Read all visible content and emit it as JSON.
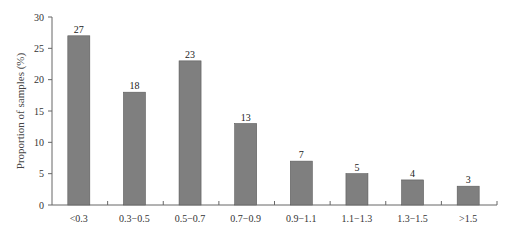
{
  "chart_data": {
    "type": "bar",
    "title": "",
    "xlabel": "",
    "ylabel": "Proportion of samples (%)",
    "categories": [
      "<0.3",
      "0.3−0.5",
      "0.5−0.7",
      "0.7−0.9",
      "0.9−1.1",
      "1.1−1.3",
      "1.3−1.5",
      ">1.5"
    ],
    "values": [
      27,
      18,
      23,
      13,
      7,
      5,
      4,
      3
    ],
    "data_labels": [
      "27",
      "18",
      "23",
      "13",
      "7",
      "5",
      "4",
      "3"
    ],
    "ylim": [
      0,
      30
    ],
    "yticks": [
      0,
      5,
      10,
      15,
      20,
      25,
      30
    ],
    "grid": false,
    "legend": null,
    "bar_color": "#7f7f7f",
    "bar_edge_color": "#5a5a5a"
  }
}
